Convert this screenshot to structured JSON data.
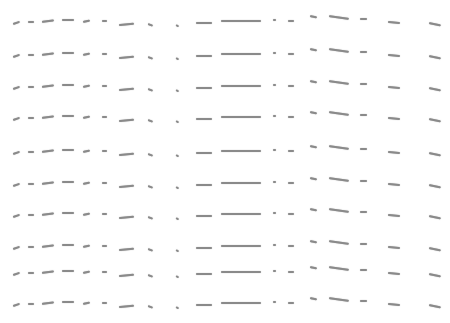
{
  "background": "#ffffff",
  "stroke_color": "#8a8a8a",
  "rows_y": [
    20,
    53,
    85,
    116,
    150,
    182,
    213,
    245,
    271,
    302
  ],
  "strokes": [
    {
      "x": 13,
      "dy": 3,
      "w": 7,
      "angle": -18
    },
    {
      "x": 28,
      "dy": 1,
      "w": 6,
      "angle": 0
    },
    {
      "x": 42,
      "dy": 1,
      "w": 12,
      "angle": -8
    },
    {
      "x": 62,
      "dy": -1,
      "w": 12,
      "angle": 0
    },
    {
      "x": 83,
      "dy": 1,
      "w": 7,
      "angle": -12
    },
    {
      "x": 102,
      "dy": 0,
      "w": 5,
      "angle": 0
    },
    {
      "x": 119,
      "dy": 4,
      "w": 15,
      "angle": -5
    },
    {
      "x": 148,
      "dy": 3,
      "w": 5,
      "angle": 20
    },
    {
      "x": 176,
      "dy": 4,
      "w": 3,
      "angle": 30
    },
    {
      "x": 196,
      "dy": 2,
      "w": 16,
      "angle": 0
    },
    {
      "x": 221,
      "dy": 0,
      "w": 40,
      "angle": 0
    },
    {
      "x": 273,
      "dy": -1,
      "w": 3,
      "angle": 0
    },
    {
      "x": 288,
      "dy": 0,
      "w": 6,
      "angle": 0
    },
    {
      "x": 310,
      "dy": -5,
      "w": 7,
      "angle": 12
    },
    {
      "x": 329,
      "dy": -5,
      "w": 20,
      "angle": 8
    },
    {
      "x": 360,
      "dy": -2,
      "w": 7,
      "angle": 0
    },
    {
      "x": 388,
      "dy": 1,
      "w": 12,
      "angle": 5
    },
    {
      "x": 429,
      "dy": 2,
      "w": 12,
      "angle": 12
    }
  ]
}
